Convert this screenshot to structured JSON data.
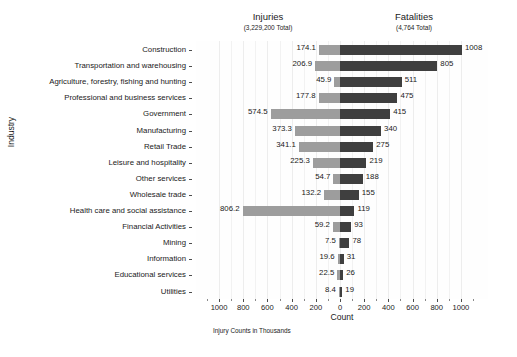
{
  "panels": {
    "left": {
      "title": "Injuries",
      "subtitle": "(3,229,200 Total)"
    },
    "right": {
      "title": "Fatalities",
      "subtitle": "(4,764 Total)"
    }
  },
  "axes": {
    "y_title": "Industry",
    "x_title": "Count",
    "x_caption": "Injury Counts in Thousands",
    "x_tick_labels": [
      "1000",
      "800",
      "600",
      "400",
      "200",
      "0",
      "200",
      "400",
      "600",
      "800",
      "1000"
    ]
  },
  "colors": {
    "injuries_bar": "#9d9d9d",
    "fatalities_bar": "#3f3f3f",
    "panel_background": "#fefefe",
    "gridline": "#ededed",
    "text": "#1a1a1a"
  },
  "chart_data": {
    "type": "bar",
    "title": "",
    "subtitle": "",
    "orientation": "horizontal",
    "layout": "diverging-tornado",
    "xlabel": "Count",
    "ylabel": "Industry",
    "annotation": "Injury Counts in Thousands",
    "grid": true,
    "legend_position": "none",
    "left_axis_direction": "reversed",
    "left_xlim": [
      0,
      1100
    ],
    "right_xlim": [
      0,
      1100
    ],
    "x_ticks": [
      1000,
      800,
      600,
      400,
      200,
      0,
      200,
      400,
      600,
      800,
      1000
    ],
    "categories": [
      "Construction",
      "Transportation and warehousing",
      "Agriculture, forestry, fishing and hunting",
      "Professional and business services",
      "Government",
      "Manufacturing",
      "Retail Trade",
      "Leisure and hospitality",
      "Other services",
      "Wholesale trade",
      "Health care and social assistance",
      "Financial Activities",
      "Mining",
      "Information",
      "Educational services",
      "Utilities"
    ],
    "series": [
      {
        "name": "Injuries",
        "units": "thousands",
        "direction": "left",
        "color": "#9d9d9d",
        "total": "3,229,200 Total",
        "values": [
          174.1,
          206.9,
          45.9,
          177.8,
          574.5,
          373.3,
          341.1,
          225.3,
          54.7,
          132.2,
          806.2,
          59.2,
          7.5,
          19.6,
          22.5,
          8.4
        ],
        "labels": [
          "174.1",
          "206.9",
          "45.9",
          "177.8",
          "574.5",
          "373.3",
          "341.1",
          "225.3",
          "54.7",
          "132.2",
          "806.2",
          "59.2",
          "7.5",
          "19.6",
          "22.5",
          "8.4"
        ]
      },
      {
        "name": "Fatalities",
        "units": "count",
        "direction": "right",
        "color": "#3f3f3f",
        "total": "4,764 Total",
        "values": [
          1008,
          805,
          511,
          475,
          415,
          340,
          275,
          219,
          188,
          155,
          119,
          93,
          78,
          31,
          26,
          19
        ],
        "labels": [
          "1008",
          "805",
          "511",
          "475",
          "415",
          "340",
          "275",
          "219",
          "188",
          "155",
          "119",
          "93",
          "78",
          "31",
          "26",
          "19"
        ]
      }
    ]
  }
}
